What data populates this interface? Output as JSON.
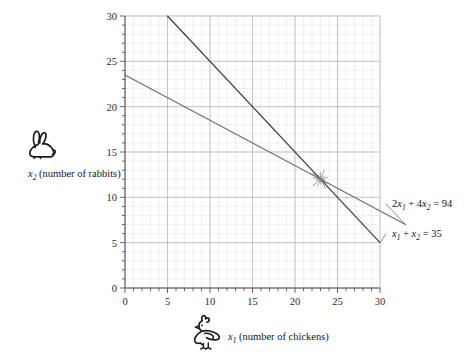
{
  "chart_data": {
    "type": "line",
    "title": "",
    "xlabel": "x1 (number of chickens)",
    "ylabel": "x2 (number of rabbits)",
    "xlim": [
      0,
      30
    ],
    "ylim": [
      0,
      30
    ],
    "xticks": [
      0,
      5,
      10,
      15,
      20,
      25,
      30
    ],
    "yticks": [
      0,
      5,
      10,
      15,
      20,
      25,
      30
    ],
    "grid": true,
    "grid_major_step": 5,
    "grid_minor_step": 1,
    "legend": "none",
    "series": [
      {
        "name": "2x1 + 4x2 = 94",
        "color": "#6e6e6e",
        "points": [
          [
            0,
            23.5
          ],
          [
            33,
            7.0
          ]
        ],
        "slope": -0.5,
        "intercept": 23.5
      },
      {
        "name": "x1 + x2 = 35",
        "color": "#3a3a3a",
        "points": [
          [
            5,
            30
          ],
          [
            30,
            5
          ]
        ],
        "slope": -1,
        "intercept": 35
      }
    ],
    "annotations": [
      {
        "kind": "intersection-marker",
        "x": 23,
        "y": 12,
        "style": "starburst"
      }
    ]
  },
  "axes": {
    "y": {
      "caption_x": "x",
      "caption_sub": "2",
      "caption_rest": "(number of rabbits)",
      "icon": "rabbit-icon",
      "ticks": [
        "30",
        "25",
        "20",
        "15",
        "10",
        "5",
        "0"
      ]
    },
    "x": {
      "caption_x": "x",
      "caption_sub": "1",
      "caption_rest": "(number of chickens)",
      "icon": "chicken-icon",
      "ticks": [
        "0",
        "5",
        "10",
        "15",
        "20",
        "25",
        "30"
      ]
    }
  },
  "equations": {
    "upper": {
      "coef1": "2",
      "var1": "x",
      "sub1": "1",
      "plus": "+",
      "coef2": "4",
      "var2": "x",
      "sub2": "2",
      "eq": "=",
      "rhs": "94"
    },
    "lower": {
      "coef1": "",
      "var1": "x",
      "sub1": "1",
      "plus": "+",
      "coef2": "",
      "var2": "x",
      "sub2": "2",
      "eq": "=",
      "rhs": "35"
    }
  },
  "colors": {
    "line_steep": "#3a3a3a",
    "line_shallow": "#6e6e6e",
    "grid_major": "#b9b9b9",
    "grid_minor": "#dfe4ef",
    "axis": "#555555",
    "text": "#151515"
  }
}
